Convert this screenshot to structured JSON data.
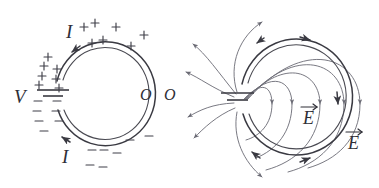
{
  "figure": {
    "background_color": "#ffffff",
    "ink_color": "#3a3a42",
    "field_color": "#6a6a74",
    "panels": [
      {
        "id": "left-panel",
        "name": "ring-surface-charge-diagram",
        "description": "Circular ring (two concentric arcs) broken at left by a battery, with plus charges on the upper half and minus charges on the lower half, current I arrows, and two O labels at the right.",
        "labels": [
          {
            "name": "current-label-top",
            "text": "I",
            "x": 66,
            "y": 38
          },
          {
            "name": "current-label-bottom",
            "text": "I",
            "x": 62,
            "y": 163
          },
          {
            "name": "voltage-label",
            "text": "V",
            "x": 14,
            "y": 103
          },
          {
            "name": "observer-label-inner",
            "text": "O",
            "x": 140,
            "y": 100
          },
          {
            "name": "observer-label-outer",
            "text": "O",
            "x": 164,
            "y": 100
          }
        ],
        "charges": {
          "positive_symbol": "+",
          "negative_symbol": "−",
          "positive_count": 14,
          "negative_count": 14
        },
        "battery": {
          "name": "battery-symbol",
          "long_plate_label": "+",
          "short_plate_label": "−"
        }
      },
      {
        "id": "right-panel",
        "name": "ring-electric-field-diagram",
        "description": "Same ring seen with electric field lines: field lines emerge from the battery gap, fan out to the left and loop around through the ring interior, converging on the right side.",
        "labels": [
          {
            "name": "e-field-label-inner",
            "text": "E",
            "x": 303,
            "y": 122,
            "vector": true
          },
          {
            "name": "e-field-label-outer",
            "text": "E",
            "x": 348,
            "y": 147,
            "vector": true
          }
        ],
        "battery": {
          "name": "battery-symbol",
          "long_plate_label": "",
          "short_plate_label": ""
        },
        "field_line_count": 16
      }
    ]
  }
}
